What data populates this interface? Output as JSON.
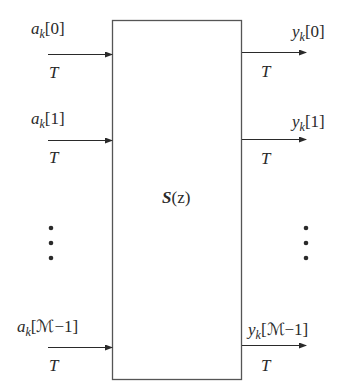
{
  "diagram": {
    "block": {
      "label_bold": "S",
      "label_rest": "(z)",
      "stroke_color": "#555555"
    },
    "inputs": [
      {
        "base": "a",
        "sub": "k",
        "index": "[0]",
        "rate": "T"
      },
      {
        "base": "a",
        "sub": "k",
        "index": "[1]",
        "rate": "T"
      },
      {
        "base": "a",
        "sub": "k",
        "index": "[ℳ−1]",
        "rate": "T"
      }
    ],
    "outputs": [
      {
        "base": "y",
        "sub": "k",
        "index": "[0]",
        "rate": "T"
      },
      {
        "base": "y",
        "sub": "k",
        "index": "[1]",
        "rate": "T"
      },
      {
        "base": "y",
        "sub": "k",
        "index": "[ℳ−1]",
        "rate": "T"
      }
    ],
    "ellipsis": "vertical-dots",
    "colors": {
      "line": "#2a2a2a",
      "text": "#2a2a2a",
      "background": "#ffffff"
    }
  }
}
